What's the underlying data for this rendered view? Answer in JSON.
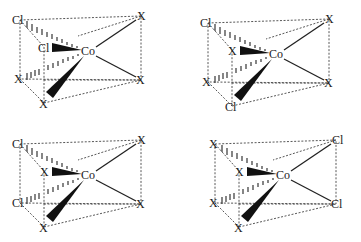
{
  "figure": {
    "panels": [
      {
        "id": "top-left",
        "center": "Co",
        "labels": {
          "top_back_left": "Cl",
          "top_back_right": "X",
          "front_mid": "Cl",
          "bottom_back_left": "X",
          "bottom_back_right": "X",
          "bottom_front": "X"
        }
      },
      {
        "id": "top-right",
        "center": "Co",
        "labels": {
          "top_back_left": "Cl",
          "top_back_right": "X",
          "front_mid": "X",
          "bottom_back_left": "X",
          "bottom_back_right": "X",
          "bottom_front": "Cl"
        }
      },
      {
        "id": "bottom-left",
        "center": "Co",
        "labels": {
          "top_back_left": "Cl",
          "top_back_right": "X",
          "front_mid": "X",
          "bottom_back_left": "Cl",
          "bottom_back_right": "X",
          "bottom_front": "X"
        }
      },
      {
        "id": "bottom-right",
        "center": "Co",
        "labels": {
          "top_back_left": "X",
          "top_back_right": "Cl",
          "front_mid": "X",
          "bottom_back_left": "X",
          "bottom_back_right": "Cl",
          "bottom_front": "X"
        }
      }
    ]
  }
}
